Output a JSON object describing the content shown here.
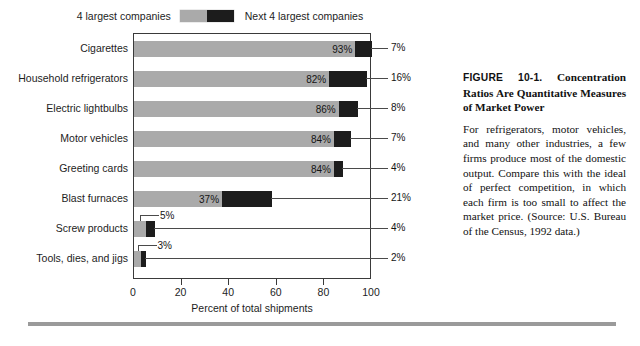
{
  "legend": {
    "left_label": "4 largest companies",
    "right_label": "Next 4 largest companies",
    "gray_swatch": "#aaaaaa",
    "black_swatch": "#1c1c1c"
  },
  "axis": {
    "x_title": "Percent of total shipments",
    "x_ticks": [
      "0",
      "20",
      "40",
      "60",
      "80",
      "100"
    ]
  },
  "caption": {
    "figure_number": "FIGURE 10-1.",
    "title": " Concentration Ratios Are Quantitative Measures of Market Power",
    "body": "For refrigerators, motor vehicles, and many other industries, a few firms produce most of the domestic output. Compare this with the ideal of perfect competition, in which each firm is too small to affect the market price. (Source: U.S. Bureau of the Census, 1992 data.)"
  },
  "chart_data": {
    "type": "bar",
    "subtype": "horizontal-stacked",
    "title": "Concentration Ratios Are Quantitative Measures of Market Power",
    "xlabel": "Percent of total shipments",
    "ylabel": "",
    "xlim": [
      0,
      100
    ],
    "xticks": [
      0,
      20,
      40,
      60,
      80,
      100
    ],
    "grid": false,
    "legend_position": "top-center",
    "categories": [
      "Cigarettes",
      "Household refrigerators",
      "Electric lightbulbs",
      "Motor vehicles",
      "Greeting cards",
      "Blast furnaces",
      "Screw products",
      "Tools, dies, and jigs"
    ],
    "series": [
      {
        "name": "4 largest companies",
        "color": "#aaaaaa",
        "values": [
          93,
          82,
          86,
          84,
          84,
          37,
          5,
          3
        ],
        "labels": [
          "93%",
          "82%",
          "86%",
          "84%",
          "84%",
          "37%",
          "5%",
          "3%"
        ]
      },
      {
        "name": "Next 4 largest companies",
        "color": "#1c1c1c",
        "values": [
          7,
          16,
          8,
          7,
          4,
          21,
          4,
          2
        ],
        "labels": [
          "7%",
          "16%",
          "8%",
          "7%",
          "4%",
          "21%",
          "4%",
          "2%"
        ]
      }
    ]
  }
}
